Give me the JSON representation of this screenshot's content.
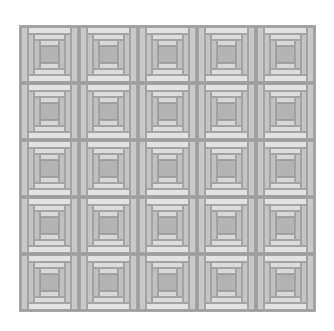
{
  "quilt": {
    "pattern": "log cabin",
    "rows": 5,
    "columns": 5,
    "colors": {
      "side_outer": "#c9c9c9",
      "topbottom_outer": "#e2e2e2",
      "side_mid": "#c4c4c4",
      "topbottom_mid": "#dcdcdc",
      "side_inner": "#c0c0c0",
      "topbottom_inner": "#d8d8d8",
      "center": "#b3b3b3",
      "seam": "#9e9e9e"
    }
  }
}
